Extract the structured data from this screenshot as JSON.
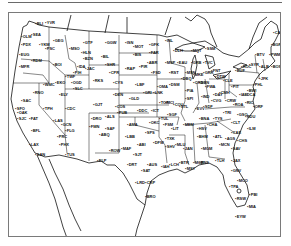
{
  "figure": {
    "type": "map",
    "colors": {
      "ink": "#111111",
      "border": "#7a7a7a",
      "background": "#ffffff"
    }
  },
  "stations": [
    {
      "id": "SEA",
      "x": 22,
      "y": 20
    },
    {
      "id": "BLI",
      "x": 26,
      "y": 9
    },
    {
      "id": "YVR",
      "x": 36,
      "y": 8
    },
    {
      "id": "OLM",
      "x": 12,
      "y": 22
    },
    {
      "id": "PDX",
      "x": 12,
      "y": 30
    },
    {
      "id": "GEG",
      "x": 44,
      "y": 26
    },
    {
      "id": "YKM",
      "x": 30,
      "y": 30
    },
    {
      "id": "PSC",
      "x": 36,
      "y": 34
    },
    {
      "id": "BOI",
      "x": 44,
      "y": 50
    },
    {
      "id": "EUG",
      "x": 10,
      "y": 40
    },
    {
      "id": "MFR",
      "x": 10,
      "y": 52
    },
    {
      "id": "RDM",
      "x": 22,
      "y": 46
    },
    {
      "id": "MSO",
      "x": 60,
      "y": 34
    },
    {
      "id": "GTF",
      "x": 74,
      "y": 28
    },
    {
      "id": "HLN",
      "x": 72,
      "y": 38
    },
    {
      "id": "BIL",
      "x": 92,
      "y": 42
    },
    {
      "id": "BZN",
      "x": 74,
      "y": 44
    },
    {
      "id": "GGW",
      "x": 96,
      "y": 28
    },
    {
      "id": "ISN",
      "x": 116,
      "y": 28
    },
    {
      "id": "MOT",
      "x": 124,
      "y": 32
    },
    {
      "id": "BIS",
      "x": 124,
      "y": 40
    },
    {
      "id": "FAR",
      "x": 140,
      "y": 38
    },
    {
      "id": "GFK",
      "x": 140,
      "y": 30
    },
    {
      "id": "INL",
      "x": 156,
      "y": 26
    },
    {
      "id": "RAP",
      "x": 116,
      "y": 54
    },
    {
      "id": "PIR",
      "x": 130,
      "y": 52
    },
    {
      "id": "FSD",
      "x": 142,
      "y": 58
    },
    {
      "id": "ABR",
      "x": 138,
      "y": 48
    },
    {
      "id": "CPR",
      "x": 100,
      "y": 58
    },
    {
      "id": "SHR",
      "x": 96,
      "y": 50
    },
    {
      "id": "JAC",
      "x": 76,
      "y": 54
    },
    {
      "id": "RKS",
      "x": 84,
      "y": 66
    },
    {
      "id": "CYS",
      "x": 104,
      "y": 68
    },
    {
      "id": "PIH",
      "x": 64,
      "y": 58
    },
    {
      "id": "IDA",
      "x": 68,
      "y": 52
    },
    {
      "id": "TWF",
      "x": 56,
      "y": 62
    },
    {
      "id": "SLC",
      "x": 64,
      "y": 74
    },
    {
      "id": "OGD",
      "x": 62,
      "y": 68
    },
    {
      "id": "ELY",
      "x": 50,
      "y": 80
    },
    {
      "id": "EKO",
      "x": 46,
      "y": 68
    },
    {
      "id": "WMC",
      "x": 34,
      "y": 70
    },
    {
      "id": "RNO",
      "x": 24,
      "y": 78
    },
    {
      "id": "SAC",
      "x": 12,
      "y": 86
    },
    {
      "id": "SFO",
      "x": 6,
      "y": 94
    },
    {
      "id": "OAK",
      "x": 8,
      "y": 98
    },
    {
      "id": "SJC",
      "x": 8,
      "y": 104
    },
    {
      "id": "FAT",
      "x": 20,
      "y": 104
    },
    {
      "id": "BFL",
      "x": 22,
      "y": 116
    },
    {
      "id": "LAX",
      "x": 20,
      "y": 130
    },
    {
      "id": "SAN",
      "x": 26,
      "y": 140
    },
    {
      "id": "LAS",
      "x": 44,
      "y": 106
    },
    {
      "id": "TPH",
      "x": 34,
      "y": 94
    },
    {
      "id": "CDC",
      "x": 56,
      "y": 94
    },
    {
      "id": "PHX",
      "x": 50,
      "y": 130
    },
    {
      "id": "TUS",
      "x": 56,
      "y": 140
    },
    {
      "id": "FLG",
      "x": 56,
      "y": 116
    },
    {
      "id": "PRC",
      "x": 48,
      "y": 122
    },
    {
      "id": "GCN",
      "x": 52,
      "y": 110
    },
    {
      "id": "GJT",
      "x": 84,
      "y": 90
    },
    {
      "id": "DEN",
      "x": 104,
      "y": 80
    },
    {
      "id": "COS",
      "x": 106,
      "y": 92
    },
    {
      "id": "PUB",
      "x": 108,
      "y": 98
    },
    {
      "id": "ALS",
      "x": 96,
      "y": 102
    },
    {
      "id": "DRO",
      "x": 82,
      "y": 104
    },
    {
      "id": "FMN",
      "x": 80,
      "y": 112
    },
    {
      "id": "ABQ",
      "x": 90,
      "y": 120
    },
    {
      "id": "SAF",
      "x": 96,
      "y": 114
    },
    {
      "id": "ROW",
      "x": 100,
      "y": 136
    },
    {
      "id": "ELP",
      "x": 88,
      "y": 146
    },
    {
      "id": "LBF",
      "x": 126,
      "y": 70
    },
    {
      "id": "OMA",
      "x": 148,
      "y": 72
    },
    {
      "id": "LNK",
      "x": 144,
      "y": 78
    },
    {
      "id": "GRI",
      "x": 134,
      "y": 78
    },
    {
      "id": "GLD",
      "x": 120,
      "y": 84
    },
    {
      "id": "DDC",
      "x": 128,
      "y": 96
    },
    {
      "id": "ICT",
      "x": 142,
      "y": 96
    },
    {
      "id": "TOP",
      "x": 150,
      "y": 88
    },
    {
      "id": "MCI",
      "x": 156,
      "y": 88
    },
    {
      "id": "AMA",
      "x": 118,
      "y": 110
    },
    {
      "id": "LBB",
      "x": 116,
      "y": 122
    },
    {
      "id": "MAF",
      "x": 112,
      "y": 134
    },
    {
      "id": "OKC",
      "x": 140,
      "y": 108
    },
    {
      "id": "TUL",
      "x": 150,
      "y": 104
    },
    {
      "id": "SPS",
      "x": 136,
      "y": 118
    },
    {
      "id": "DFW",
      "x": 144,
      "y": 128
    },
    {
      "id": "ABI",
      "x": 128,
      "y": 130
    },
    {
      "id": "SJT",
      "x": 124,
      "y": 140
    },
    {
      "id": "AUS",
      "x": 138,
      "y": 150
    },
    {
      "id": "SAT",
      "x": 132,
      "y": 156
    },
    {
      "id": "IAH",
      "x": 152,
      "y": 152
    },
    {
      "id": "CRP",
      "x": 136,
      "y": 168
    },
    {
      "id": "BRO",
      "x": 136,
      "y": 182
    },
    {
      "id": "LRD",
      "x": 126,
      "y": 168
    },
    {
      "id": "DRT",
      "x": 118,
      "y": 150
    },
    {
      "id": "MSP",
      "x": 156,
      "y": 48
    },
    {
      "id": "DLH",
      "x": 164,
      "y": 36
    },
    {
      "id": "RST",
      "x": 160,
      "y": 58
    },
    {
      "id": "DSM",
      "x": 160,
      "y": 70
    },
    {
      "id": "DBQ",
      "x": 172,
      "y": 64
    },
    {
      "id": "EAU",
      "x": 168,
      "y": 48
    },
    {
      "id": "GRB",
      "x": 182,
      "y": 48
    },
    {
      "id": "MKE",
      "x": 184,
      "y": 60
    },
    {
      "id": "MSN",
      "x": 176,
      "y": 58
    },
    {
      "id": "ORD",
      "x": 184,
      "y": 68
    },
    {
      "id": "PIA",
      "x": 176,
      "y": 76
    },
    {
      "id": "SPI",
      "x": 176,
      "y": 84
    },
    {
      "id": "STL",
      "x": 170,
      "y": 92
    },
    {
      "id": "SGF",
      "x": 158,
      "y": 100
    },
    {
      "id": "COU",
      "x": 164,
      "y": 90
    },
    {
      "id": "MQT",
      "x": 182,
      "y": 36
    },
    {
      "id": "SSM",
      "x": 196,
      "y": 34
    },
    {
      "id": "TVC",
      "x": 194,
      "y": 48
    },
    {
      "id": "GRR",
      "x": 194,
      "y": 58
    },
    {
      "id": "DTW",
      "x": 206,
      "y": 62
    },
    {
      "id": "FNT",
      "x": 202,
      "y": 56
    },
    {
      "id": "SBN",
      "x": 190,
      "y": 68
    },
    {
      "id": "FWA",
      "x": 196,
      "y": 72
    },
    {
      "id": "IND",
      "x": 192,
      "y": 82
    },
    {
      "id": "CLE",
      "x": 214,
      "y": 66
    },
    {
      "id": "CMH",
      "x": 210,
      "y": 78
    },
    {
      "id": "CVG",
      "x": 202,
      "y": 86
    },
    {
      "id": "DAY",
      "x": 204,
      "y": 80
    },
    {
      "id": "SDF",
      "x": 194,
      "y": 92
    },
    {
      "id": "EVV",
      "x": 186,
      "y": 94
    },
    {
      "id": "PIT",
      "x": 222,
      "y": 72
    },
    {
      "id": "BUF",
      "x": 226,
      "y": 56
    },
    {
      "id": "ROC",
      "x": 232,
      "y": 52
    },
    {
      "id": "SYR",
      "x": 240,
      "y": 50
    },
    {
      "id": "ALB",
      "x": 250,
      "y": 52
    },
    {
      "id": "BOS",
      "x": 262,
      "y": 52
    },
    {
      "id": "PWM",
      "x": 260,
      "y": 40
    },
    {
      "id": "BGR",
      "x": 262,
      "y": 30
    },
    {
      "id": "CAR",
      "x": 264,
      "y": 18
    },
    {
      "id": "BTV",
      "x": 246,
      "y": 40
    },
    {
      "id": "JFK",
      "x": 250,
      "y": 64
    },
    {
      "id": "PHL",
      "x": 244,
      "y": 70
    },
    {
      "id": "BWI",
      "x": 238,
      "y": 76
    },
    {
      "id": "DCA",
      "x": 236,
      "y": 80
    },
    {
      "id": "IAD",
      "x": 230,
      "y": 80
    },
    {
      "id": "RIC",
      "x": 236,
      "y": 88
    },
    {
      "id": "ORF",
      "x": 244,
      "y": 92
    },
    {
      "id": "ROA",
      "x": 224,
      "y": 90
    },
    {
      "id": "CRW",
      "x": 216,
      "y": 86
    },
    {
      "id": "TRI",
      "x": 214,
      "y": 98
    },
    {
      "id": "TYS",
      "x": 204,
      "y": 104
    },
    {
      "id": "BNA",
      "x": 190,
      "y": 104
    },
    {
      "id": "MEM",
      "x": 174,
      "y": 110
    },
    {
      "id": "LIT",
      "x": 162,
      "y": 114
    },
    {
      "id": "FSM",
      "x": 154,
      "y": 110
    },
    {
      "id": "TXK",
      "x": 156,
      "y": 124
    },
    {
      "id": "SHV",
      "x": 156,
      "y": 132
    },
    {
      "id": "MLU",
      "x": 166,
      "y": 130
    },
    {
      "id": "JAN",
      "x": 174,
      "y": 134
    },
    {
      "id": "BTR",
      "x": 170,
      "y": 148
    },
    {
      "id": "MSY",
      "x": 176,
      "y": 154
    },
    {
      "id": "LCH",
      "x": 160,
      "y": 150
    },
    {
      "id": "MOB",
      "x": 184,
      "y": 148
    },
    {
      "id": "BHM",
      "x": 188,
      "y": 122
    },
    {
      "id": "HSV",
      "x": 188,
      "y": 114
    },
    {
      "id": "MGM",
      "x": 192,
      "y": 134
    },
    {
      "id": "CHA",
      "x": 198,
      "y": 110
    },
    {
      "id": "ATL",
      "x": 204,
      "y": 122
    },
    {
      "id": "MCN",
      "x": 210,
      "y": 130
    },
    {
      "id": "AGS",
      "x": 216,
      "y": 124
    },
    {
      "id": "CAE",
      "x": 222,
      "y": 118
    },
    {
      "id": "CLT",
      "x": 222,
      "y": 108
    },
    {
      "id": "GSO",
      "x": 228,
      "y": 100
    },
    {
      "id": "RDU",
      "x": 236,
      "y": 102
    },
    {
      "id": "ILM",
      "x": 238,
      "y": 114
    },
    {
      "id": "CHS",
      "x": 228,
      "y": 126
    },
    {
      "id": "SAV",
      "x": 222,
      "y": 134
    },
    {
      "id": "JAX",
      "x": 222,
      "y": 146
    },
    {
      "id": "TLH",
      "x": 206,
      "y": 146
    },
    {
      "id": "PNS",
      "x": 190,
      "y": 148
    },
    {
      "id": "GNV",
      "x": 222,
      "y": 156
    },
    {
      "id": "MCO",
      "x": 228,
      "y": 166
    },
    {
      "id": "TPA",
      "x": 220,
      "y": 172
    },
    {
      "id": "RSW",
      "x": 226,
      "y": 184
    },
    {
      "id": "PBI",
      "x": 240,
      "y": 180
    },
    {
      "id": "MIA",
      "x": 238,
      "y": 192
    },
    {
      "id": "EYW",
      "x": 226,
      "y": 202
    }
  ]
}
